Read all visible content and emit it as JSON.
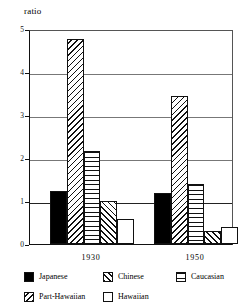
{
  "chart_data": {
    "type": "bar",
    "title": "",
    "xlabel": "",
    "ylabel": "ratio",
    "ylim": [
      0,
      5
    ],
    "yticks": [
      "0",
      "1",
      "2",
      "3",
      "4",
      "5"
    ],
    "grid": true,
    "legend_position": "bottom",
    "categories": [
      "1930",
      "1950"
    ],
    "series": [
      {
        "name": "Japanese",
        "fill": "solid",
        "values": [
          1.23,
          1.19
        ]
      },
      {
        "name": "Part-Hawaiian",
        "fill": "diag-l",
        "values": [
          4.77,
          3.44
        ]
      },
      {
        "name": "Caucasian",
        "fill": "horiz",
        "values": [
          2.16,
          1.4
        ]
      },
      {
        "name": "Chinese",
        "fill": "diag-r",
        "values": [
          1.0,
          0.3
        ]
      },
      {
        "name": "Hawaiian",
        "fill": "white",
        "values": [
          0.58,
          0.4
        ]
      }
    ]
  },
  "legend": {
    "items": [
      {
        "label": "Japanese",
        "fill": "solid"
      },
      {
        "label": "Chinese",
        "fill": "diag-r"
      },
      {
        "label": "Caucasian",
        "fill": "horiz"
      },
      {
        "label": "Part-Hawaiian",
        "fill": "diag-l"
      },
      {
        "label": "Hawaiian",
        "fill": "white"
      }
    ]
  }
}
